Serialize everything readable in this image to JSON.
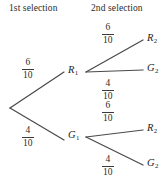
{
  "diagram": {
    "type": "probability-tree",
    "headers": {
      "first": "1st selection",
      "second": "2nd selection"
    },
    "nodes": {
      "root": {
        "label": "",
        "x": 10,
        "y": 108
      },
      "r1": {
        "letter": "R",
        "sub": "1",
        "x": 85,
        "y": 72
      },
      "g1": {
        "letter": "G",
        "sub": "1",
        "x": 85,
        "y": 137
      },
      "r2_from_r1": {
        "letter": "R",
        "sub": "2"
      },
      "g2_from_r1": {
        "letter": "G",
        "sub": "2"
      },
      "r2_from_g1": {
        "letter": "R",
        "sub": "2"
      },
      "g2_from_g1": {
        "letter": "G",
        "sub": "2"
      }
    },
    "branches": {
      "root_to_r1": {
        "numerator": "6",
        "denominator": "10"
      },
      "root_to_g1": {
        "numerator": "4",
        "denominator": "10"
      },
      "r1_to_r2": {
        "numerator": "6",
        "denominator": "10"
      },
      "r1_to_g2": {
        "numerator": "4",
        "denominator": "10"
      },
      "g1_to_r2": {
        "numerator": "6",
        "denominator": "10"
      },
      "g1_to_g2": {
        "numerator": "4",
        "denominator": "10"
      }
    },
    "colors": {
      "line": "#4a4a4a",
      "text": "#2b2b2b",
      "background": "#ffffff"
    }
  }
}
